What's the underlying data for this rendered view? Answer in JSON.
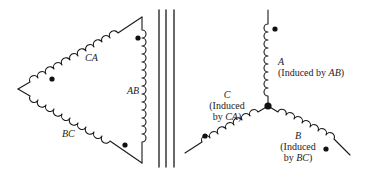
{
  "primary_delta": {
    "windings": [
      {
        "name": "CA",
        "label": "CA"
      },
      {
        "name": "AB",
        "label": "AB"
      },
      {
        "name": "BC",
        "label": "BC"
      }
    ]
  },
  "core": {
    "lines": 3
  },
  "secondary_wye": {
    "windings": [
      {
        "name": "A",
        "label": "A",
        "induced_prefix": "(Induced by ",
        "induced_by": "AB",
        "induced_suffix": ")"
      },
      {
        "name": "C",
        "label": "C",
        "induced_line1": "(Induced",
        "induced_prefix": "by ",
        "induced_by": "CA",
        "induced_suffix": ")"
      },
      {
        "name": "B",
        "label": "B",
        "induced_line1": "(Induced",
        "induced_prefix": "by ",
        "induced_by": "BC",
        "induced_suffix": ")"
      }
    ]
  },
  "colors": {
    "stroke": "#1a1a1a",
    "background": "#ffffff"
  }
}
